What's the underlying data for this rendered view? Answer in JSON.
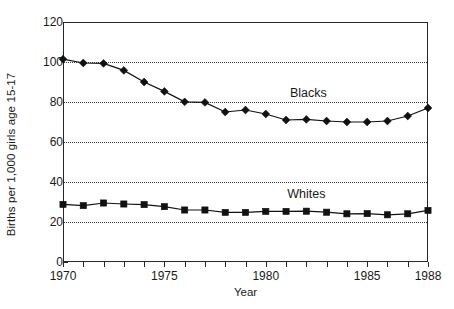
{
  "chart_data": {
    "type": "line",
    "title": "",
    "xlabel": "Year",
    "ylabel": "Births per 1,000 girls age 15-17",
    "xlim": [
      1970,
      1988
    ],
    "ylim": [
      0,
      120
    ],
    "grid": true,
    "grid_axis": "y",
    "legend_position": "inline-annotation",
    "x": [
      1970,
      1971,
      1972,
      1973,
      1974,
      1975,
      1976,
      1977,
      1978,
      1979,
      1980,
      1981,
      1982,
      1983,
      1984,
      1985,
      1986,
      1987,
      1988
    ],
    "y_ticks": [
      0,
      20,
      40,
      60,
      80,
      100,
      120
    ],
    "x_ticks": [
      1970,
      1971,
      1972,
      1973,
      1974,
      1975,
      1976,
      1977,
      1978,
      1979,
      1980,
      1981,
      1982,
      1983,
      1984,
      1985,
      1986,
      1987,
      1988
    ],
    "x_tick_labels": [
      {
        "value": 1970,
        "label": "1970"
      },
      {
        "value": 1975,
        "label": "1975"
      },
      {
        "value": 1980,
        "label": "1980"
      },
      {
        "value": 1985,
        "label": "1985"
      },
      {
        "value": 1988,
        "label": "1988"
      }
    ],
    "series": [
      {
        "name": "Blacks",
        "marker": "diamond",
        "color": "#111111",
        "annotation": {
          "text": "Blacks",
          "x": 1982.1,
          "y": 84.5
        },
        "values": [
          101.4,
          99.5,
          99.3,
          95.8,
          90.0,
          85.3,
          80.1,
          79.8,
          75.0,
          76.0,
          74.0,
          71.0,
          71.3,
          70.5,
          70.0,
          70.0,
          70.5,
          73.0,
          77.0
        ]
      },
      {
        "name": "Whites",
        "marker": "square",
        "color": "#111111",
        "annotation": {
          "text": "Whites",
          "x": 1982.0,
          "y": 34.0
        },
        "values": [
          28.8,
          28.2,
          29.5,
          29.0,
          28.7,
          27.7,
          26.0,
          26.0,
          24.8,
          24.8,
          25.3,
          25.3,
          25.4,
          24.9,
          24.1,
          24.2,
          23.6,
          24.1,
          25.8
        ]
      }
    ]
  }
}
